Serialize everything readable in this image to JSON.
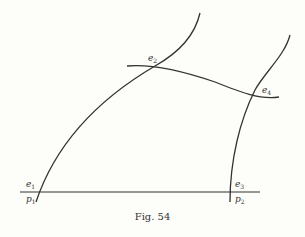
{
  "figure": {
    "caption": "Fig. 54",
    "labels": {
      "e1": {
        "base": "e",
        "sub": "1"
      },
      "p1": {
        "base": "p",
        "sub": "1"
      },
      "e2": {
        "base": "e",
        "sub": "2"
      },
      "e3": {
        "base": "e",
        "sub": "3"
      },
      "p2": {
        "base": "p",
        "sub": "2"
      },
      "e4": {
        "base": "e",
        "sub": "4"
      }
    },
    "stroke_color": "#333333",
    "background_color": "#fdfdf9"
  }
}
